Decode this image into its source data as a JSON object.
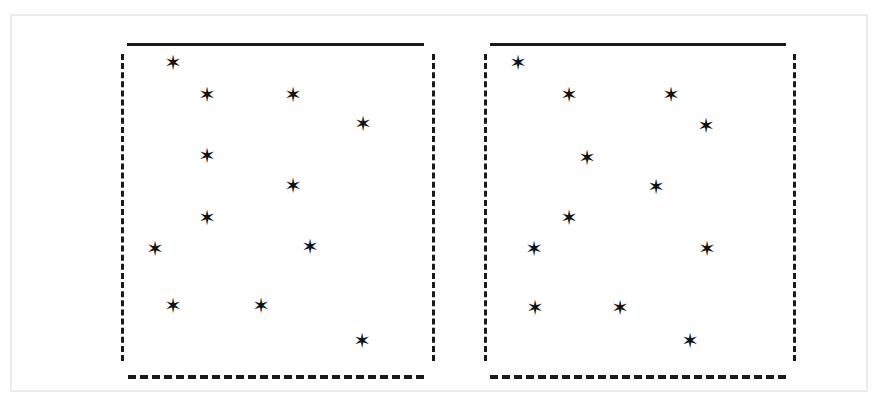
{
  "figure": {
    "title": "",
    "background_color": "#ffffff",
    "frame_color": "#ececec",
    "ink_color": "#1a1a1a",
    "marker_glyph": "✶",
    "marker_name": "asterisk-star-marker"
  },
  "chart_data": {
    "type": "scatter",
    "title": "",
    "xlabel": "",
    "ylabel": "",
    "grid": false,
    "legend": null,
    "axis_style": {
      "top": "solid",
      "bottom": "dashed",
      "left": "dashed",
      "right": "dashed"
    },
    "panels": [
      {
        "name": "left-panel",
        "xlim": [
          0,
          100
        ],
        "ylim": [
          0,
          100
        ],
        "points": [
          {
            "x": 17.0,
            "y": 93.7
          },
          {
            "x": 28.0,
            "y": 84.0
          },
          {
            "x": 55.5,
            "y": 84.0
          },
          {
            "x": 78.5,
            "y": 74.1
          },
          {
            "x": 28.0,
            "y": 64.2
          },
          {
            "x": 55.5,
            "y": 53.6
          },
          {
            "x": 28.0,
            "y": 44.0
          },
          {
            "x": 11.5,
            "y": 34.4
          },
          {
            "x": 61.0,
            "y": 34.4
          },
          {
            "x": 17.0,
            "y": 14.9
          },
          {
            "x": 44.5,
            "y": 14.9
          },
          {
            "x": 77.8,
            "y": 4.6
          }
        ]
      },
      {
        "name": "right-panel",
        "xlim": [
          0,
          100
        ],
        "ylim": [
          0,
          100
        ],
        "points": [
          {
            "x": 11.5,
            "y": 93.7
          },
          {
            "x": 28.0,
            "y": 83.7
          },
          {
            "x": 61.0,
            "y": 83.7
          },
          {
            "x": 72.3,
            "y": 73.7
          },
          {
            "x": 33.5,
            "y": 63.4
          },
          {
            "x": 55.5,
            "y": 53.6
          },
          {
            "x": 28.0,
            "y": 44.0
          },
          {
            "x": 16.5,
            "y": 34.4
          },
          {
            "x": 72.0,
            "y": 34.4
          },
          {
            "x": 16.8,
            "y": 14.6
          },
          {
            "x": 44.2,
            "y": 14.6
          },
          {
            "x": 66.5,
            "y": 4.6
          }
        ]
      }
    ]
  },
  "panel_geometry": [
    {
      "name": "left-panel",
      "left": 127,
      "top": 43,
      "width": 297,
      "height": 332,
      "stars": [
        {
          "x": 173,
          "y": 63
        },
        {
          "x": 207,
          "y": 95
        },
        {
          "x": 293,
          "y": 95
        },
        {
          "x": 363,
          "y": 124
        },
        {
          "x": 207,
          "y": 156
        },
        {
          "x": 293,
          "y": 186
        },
        {
          "x": 207,
          "y": 218
        },
        {
          "x": 155,
          "y": 249
        },
        {
          "x": 310,
          "y": 247
        },
        {
          "x": 173,
          "y": 306
        },
        {
          "x": 261,
          "y": 306
        },
        {
          "x": 362,
          "y": 341
        }
      ]
    },
    {
      "name": "right-panel",
      "left": 490,
      "top": 43,
      "width": 296,
      "height": 332,
      "stars": [
        {
          "x": 518,
          "y": 63
        },
        {
          "x": 569,
          "y": 95
        },
        {
          "x": 671,
          "y": 95
        },
        {
          "x": 706,
          "y": 126
        },
        {
          "x": 587,
          "y": 158
        },
        {
          "x": 656,
          "y": 187
        },
        {
          "x": 569,
          "y": 218
        },
        {
          "x": 534,
          "y": 249
        },
        {
          "x": 707,
          "y": 249
        },
        {
          "x": 535,
          "y": 308
        },
        {
          "x": 620,
          "y": 308
        },
        {
          "x": 690,
          "y": 341
        }
      ]
    }
  ]
}
